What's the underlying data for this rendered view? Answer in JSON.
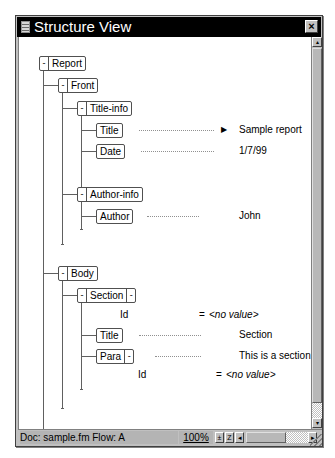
{
  "window": {
    "title": "Structure View",
    "close_glyph": "×"
  },
  "tree": {
    "report": {
      "label": "Report",
      "toggle": "-"
    },
    "front": {
      "label": "Front",
      "toggle": "-"
    },
    "title_info": {
      "label": "Title-info",
      "toggle": "-"
    },
    "title": {
      "label": "Title",
      "value": "Sample report",
      "marker": "▶"
    },
    "date": {
      "label": "Date",
      "value": "1/7/99"
    },
    "author_info": {
      "label": "Author-info",
      "toggle": "-"
    },
    "author": {
      "label": "Author",
      "value": "John"
    },
    "body": {
      "label": "Body",
      "toggle": "-"
    },
    "section": {
      "label": "Section",
      "toggle": "-",
      "attr_toggle": "-",
      "attribute": {
        "name": "Id",
        "eq": "=",
        "value": "<no value>"
      }
    },
    "section_title": {
      "label": "Title",
      "value": "Section"
    },
    "para": {
      "label": "Para",
      "attr_toggle": "-",
      "value": "This is a section.",
      "attribute": {
        "name": "Id",
        "eq": "=",
        "value": "<no value>"
      }
    }
  },
  "statusbar": {
    "doc_text": "Doc: sample.fm Flow: A",
    "zoom": "100%",
    "zoom_out": "±",
    "zoom_in": "Z",
    "scroll_left": "◂",
    "scroll_right": "▸"
  },
  "vscroll": {
    "up": "▴",
    "down": "▾"
  }
}
